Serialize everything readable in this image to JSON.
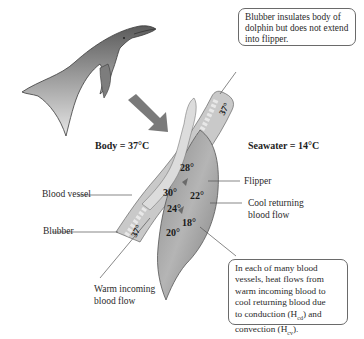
{
  "diagram": {
    "title_left": "Body = 37°C",
    "title_right": "Seawater = 14°C",
    "callouts": {
      "top": "Blubber insulates body of dolphin but does not extend into flipper.",
      "bottom_lines": [
        "In each of many blood",
        "vessels, heat flows from",
        "warm incoming blood to",
        "cool returning blood due",
        "to conduction (H",
        "cd",
        ") and",
        "convection (H",
        "cv",
        ")."
      ]
    },
    "labels": {
      "blood_vessel": "Blood vessel",
      "blubber": "Blubber",
      "warm_incoming_1": "Warm incoming",
      "warm_incoming_2": "blood flow",
      "flipper": "Flipper",
      "cool_returning_1": "Cool returning",
      "cool_returning_2": "blood flow"
    },
    "temperatures": {
      "top_vessel": "37°",
      "left_vessel": "37°",
      "t28": "28°",
      "t30": "30°",
      "t22": "22°",
      "t24": "24°",
      "t18": "18°",
      "t20": "20°"
    },
    "colors": {
      "arrow": "#7a7a7a",
      "flipper": "#a9a9a9",
      "blubber": "#c9c9c9",
      "vessel": "#d8d8d8",
      "outline": "#555555"
    }
  }
}
